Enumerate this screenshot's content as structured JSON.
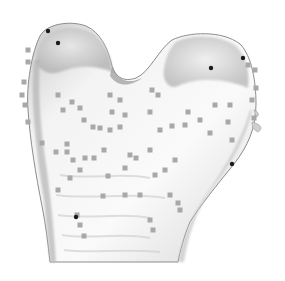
{
  "scene": {
    "subject": "3D rendered bone surface (distal femur) with landmark markers",
    "background_color": "#ffffff",
    "surface_color": "#e6e6e6",
    "shadow_color": "#9a9a9a",
    "landmark_square_color": "#a8a8a8",
    "anchor_dot_color": "#1a1a1a"
  },
  "landmarks": {
    "squares": [
      [
        58,
        95
      ],
      [
        63,
        110
      ],
      [
        72,
        102
      ],
      [
        80,
        108
      ],
      [
        84,
        120
      ],
      [
        93,
        127
      ],
      [
        100,
        128
      ],
      [
        110,
        130
      ],
      [
        120,
        127
      ],
      [
        125,
        115
      ],
      [
        112,
        112
      ],
      [
        42,
        143
      ],
      [
        56,
        152
      ],
      [
        67,
        144
      ],
      [
        73,
        160
      ],
      [
        85,
        158
      ],
      [
        94,
        158
      ],
      [
        104,
        150
      ],
      [
        108,
        176
      ],
      [
        125,
        168
      ],
      [
        130,
        155
      ],
      [
        136,
        158
      ],
      [
        150,
        150
      ],
      [
        160,
        130
      ],
      [
        172,
        126
      ],
      [
        185,
        125
      ],
      [
        188,
        112
      ],
      [
        150,
        112
      ],
      [
        158,
        95
      ],
      [
        152,
        90
      ],
      [
        210,
        133
      ],
      [
        200,
        120
      ],
      [
        175,
        160
      ],
      [
        165,
        170
      ],
      [
        155,
        175
      ],
      [
        125,
        195
      ],
      [
        103,
        196
      ],
      [
        140,
        195
      ],
      [
        70,
        178
      ],
      [
        80,
        170
      ],
      [
        58,
        190
      ],
      [
        77,
        215
      ],
      [
        80,
        225
      ],
      [
        84,
        236
      ],
      [
        67,
        152
      ],
      [
        110,
        95
      ],
      [
        120,
        100
      ],
      [
        170,
        195
      ],
      [
        178,
        203
      ],
      [
        180,
        210
      ],
      [
        150,
        220
      ],
      [
        153,
        230
      ],
      [
        215,
        105
      ],
      [
        230,
        105
      ],
      [
        228,
        122
      ],
      [
        232,
        140
      ],
      [
        28,
        50
      ],
      [
        28,
        62
      ],
      [
        24,
        82
      ],
      [
        22,
        95
      ],
      [
        25,
        105
      ],
      [
        28,
        122
      ],
      [
        248,
        65
      ],
      [
        255,
        70
      ],
      [
        256,
        88
      ],
      [
        252,
        100
      ],
      [
        254,
        118
      ]
    ],
    "dots": [
      [
        48,
        31
      ],
      [
        58,
        43
      ],
      [
        211,
        68
      ],
      [
        243,
        58
      ],
      [
        76,
        217
      ],
      [
        232,
        164
      ]
    ]
  }
}
